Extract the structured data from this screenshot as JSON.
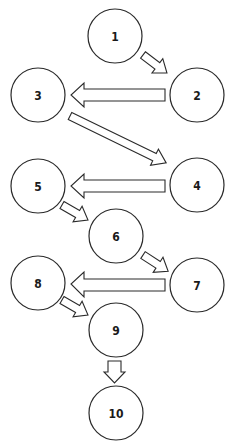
{
  "diagram": {
    "type": "flow-sequence",
    "nodes": [
      {
        "id": 1,
        "label": "1",
        "cx": 115,
        "cy": 36
      },
      {
        "id": 2,
        "label": "2",
        "cx": 197,
        "cy": 95
      },
      {
        "id": 3,
        "label": "3",
        "cx": 38,
        "cy": 95
      },
      {
        "id": 4,
        "label": "4",
        "cx": 197,
        "cy": 185
      },
      {
        "id": 5,
        "label": "5",
        "cx": 38,
        "cy": 186
      },
      {
        "id": 6,
        "label": "6",
        "cx": 116,
        "cy": 236
      },
      {
        "id": 7,
        "label": "7",
        "cx": 197,
        "cy": 285
      },
      {
        "id": 8,
        "label": "8",
        "cx": 38,
        "cy": 283
      },
      {
        "id": 9,
        "label": "9",
        "cx": 116,
        "cy": 330
      },
      {
        "id": 10,
        "label": "10",
        "cx": 116,
        "cy": 413
      }
    ],
    "edges": [
      {
        "from": 1,
        "to": 2
      },
      {
        "from": 2,
        "to": 3
      },
      {
        "from": 3,
        "to": 4
      },
      {
        "from": 4,
        "to": 5
      },
      {
        "from": 5,
        "to": 6
      },
      {
        "from": 6,
        "to": 7
      },
      {
        "from": 7,
        "to": 8
      },
      {
        "from": 8,
        "to": 9
      },
      {
        "from": 9,
        "to": 10
      }
    ]
  }
}
